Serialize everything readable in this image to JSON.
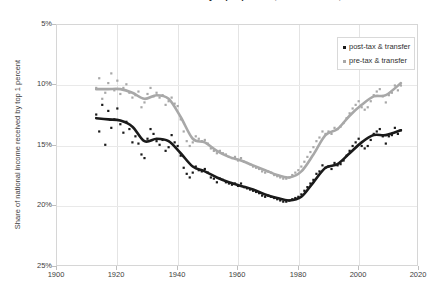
{
  "title": "Share of national income received by top 1 percent, United States, 1913-2014",
  "legend": {
    "position": "top-right",
    "items": [
      {
        "label": "post-tax & transfer",
        "color": "#1a1a1a"
      },
      {
        "label": "pre-tax & transfer",
        "color": "#a8a8a8"
      }
    ]
  },
  "axes": {
    "ylabel": "Share of national income received by top 1 percent",
    "xlabel": "",
    "yticks": [
      "5%",
      "10%",
      "15%",
      "20%",
      "25%"
    ],
    "xticks": [
      "1900",
      "1920",
      "1940",
      "1960",
      "1980",
      "2000",
      "2020"
    ]
  },
  "colors": {
    "post_tax": "#1a1a1a",
    "pre_tax": "#a8a8a8",
    "grid": "#e4e4e4",
    "frame": "#d6d6d6",
    "text": "#3d3d3d"
  },
  "chart_data": {
    "type": "scatter",
    "title": "Share of national income received by top 1 percent, United States, 1913-2014",
    "xlabel": "",
    "ylabel": "Share of national income received by top 1 percent",
    "xlim": [
      1900,
      2020
    ],
    "ylim": [
      25,
      5
    ],
    "y_axis_inverted": true,
    "yticks": [
      5,
      10,
      15,
      20,
      25
    ],
    "xticks": [
      1900,
      1920,
      1940,
      1960,
      1980,
      2000,
      2020
    ],
    "grid": true,
    "legend": [
      "post-tax & transfer",
      "pre-tax & transfer"
    ],
    "series": [
      {
        "name": "post-tax & transfer",
        "color": "#1a1a1a",
        "marker": "square",
        "points": [
          [
            1913,
            17.6
          ],
          [
            1914,
            16.2
          ],
          [
            1915,
            18.4
          ],
          [
            1916,
            15.1
          ],
          [
            1917,
            17.9
          ],
          [
            1918,
            16.5
          ],
          [
            1919,
            17.2
          ],
          [
            1920,
            18.1
          ],
          [
            1921,
            16.8
          ],
          [
            1922,
            16.1
          ],
          [
            1923,
            17.0
          ],
          [
            1924,
            16.4
          ],
          [
            1925,
            15.3
          ],
          [
            1926,
            15.8
          ],
          [
            1927,
            15.2
          ],
          [
            1928,
            14.3
          ],
          [
            1929,
            14.0
          ],
          [
            1930,
            15.6
          ],
          [
            1931,
            16.4
          ],
          [
            1932,
            16.0
          ],
          [
            1933,
            15.4
          ],
          [
            1934,
            15.1
          ],
          [
            1935,
            15.5
          ],
          [
            1936,
            14.6
          ],
          [
            1937,
            14.9
          ],
          [
            1938,
            15.9
          ],
          [
            1939,
            15.3
          ],
          [
            1940,
            15.0
          ],
          [
            1941,
            14.2
          ],
          [
            1942,
            13.2
          ],
          [
            1943,
            12.7
          ],
          [
            1944,
            12.4
          ],
          [
            1945,
            12.8
          ],
          [
            1946,
            13.3
          ],
          [
            1947,
            13.0
          ],
          [
            1948,
            12.9
          ],
          [
            1949,
            13.1
          ],
          [
            1950,
            12.8
          ],
          [
            1951,
            12.4
          ],
          [
            1952,
            12.3
          ],
          [
            1953,
            12.0
          ],
          [
            1954,
            12.3
          ],
          [
            1955,
            12.2
          ],
          [
            1956,
            12.0
          ],
          [
            1957,
            11.9
          ],
          [
            1958,
            11.8
          ],
          [
            1959,
            11.9
          ],
          [
            1960,
            11.7
          ],
          [
            1961,
            11.9
          ],
          [
            1962,
            11.6
          ],
          [
            1963,
            11.5
          ],
          [
            1964,
            11.4
          ],
          [
            1965,
            11.3
          ],
          [
            1966,
            11.2
          ],
          [
            1967,
            11.1
          ],
          [
            1968,
            10.9
          ],
          [
            1969,
            10.8
          ],
          [
            1970,
            10.9
          ],
          [
            1971,
            10.8
          ],
          [
            1972,
            10.7
          ],
          [
            1973,
            10.6
          ],
          [
            1974,
            10.5
          ],
          [
            1975,
            10.4
          ],
          [
            1976,
            10.4
          ],
          [
            1977,
            10.5
          ],
          [
            1978,
            10.6
          ],
          [
            1979,
            10.7
          ],
          [
            1980,
            10.8
          ],
          [
            1981,
            11.0
          ],
          [
            1982,
            11.3
          ],
          [
            1983,
            11.6
          ],
          [
            1984,
            11.9
          ],
          [
            1985,
            12.2
          ],
          [
            1986,
            12.7
          ],
          [
            1987,
            12.9
          ],
          [
            1988,
            13.4
          ],
          [
            1989,
            13.2
          ],
          [
            1990,
            13.3
          ],
          [
            1991,
            13.1
          ],
          [
            1992,
            13.6
          ],
          [
            1993,
            13.4
          ],
          [
            1994,
            13.5
          ],
          [
            1995,
            13.8
          ],
          [
            1996,
            14.2
          ],
          [
            1997,
            14.6
          ],
          [
            1998,
            15.0
          ],
          [
            1999,
            15.3
          ],
          [
            2000,
            15.6
          ],
          [
            2001,
            15.0
          ],
          [
            2002,
            14.8
          ],
          [
            2003,
            15.0
          ],
          [
            2004,
            15.5
          ],
          [
            2005,
            16.0
          ],
          [
            2006,
            16.2
          ],
          [
            2007,
            16.4
          ],
          [
            2008,
            15.8
          ],
          [
            2009,
            15.2
          ],
          [
            2010,
            15.8
          ],
          [
            2011,
            15.9
          ],
          [
            2012,
            16.5
          ],
          [
            2013,
            16.0
          ],
          [
            2014,
            16.3
          ]
        ],
        "trend": [
          [
            1913,
            17.3
          ],
          [
            1917,
            17.2
          ],
          [
            1921,
            17.1
          ],
          [
            1925,
            16.6
          ],
          [
            1929,
            15.4
          ],
          [
            1933,
            15.6
          ],
          [
            1937,
            15.4
          ],
          [
            1941,
            14.4
          ],
          [
            1945,
            13.3
          ],
          [
            1949,
            12.9
          ],
          [
            1953,
            12.4
          ],
          [
            1957,
            12.0
          ],
          [
            1961,
            11.7
          ],
          [
            1965,
            11.4
          ],
          [
            1969,
            11.0
          ],
          [
            1973,
            10.7
          ],
          [
            1977,
            10.5
          ],
          [
            1981,
            10.8
          ],
          [
            1985,
            12.0
          ],
          [
            1989,
            13.2
          ],
          [
            1993,
            13.5
          ],
          [
            1997,
            14.4
          ],
          [
            2001,
            15.3
          ],
          [
            2005,
            15.9
          ],
          [
            2009,
            15.9
          ],
          [
            2014,
            16.3
          ]
        ]
      },
      {
        "name": "pre-tax & transfer",
        "color": "#a8a8a8",
        "marker": "square",
        "points": [
          [
            1913,
            19.8
          ],
          [
            1914,
            20.6
          ],
          [
            1915,
            18.9
          ],
          [
            1916,
            19.4
          ],
          [
            1917,
            20.2
          ],
          [
            1918,
            21.0
          ],
          [
            1919,
            19.6
          ],
          [
            1920,
            20.4
          ],
          [
            1921,
            19.3
          ],
          [
            1922,
            19.8
          ],
          [
            1923,
            20.1
          ],
          [
            1924,
            19.4
          ],
          [
            1925,
            19.0
          ],
          [
            1926,
            19.2
          ],
          [
            1927,
            19.5
          ],
          [
            1928,
            18.2
          ],
          [
            1929,
            18.6
          ],
          [
            1930,
            19.3
          ],
          [
            1931,
            19.8
          ],
          [
            1932,
            19.1
          ],
          [
            1933,
            19.4
          ],
          [
            1934,
            19.0
          ],
          [
            1935,
            19.2
          ],
          [
            1936,
            18.4
          ],
          [
            1937,
            18.7
          ],
          [
            1938,
            19.0
          ],
          [
            1939,
            18.5
          ],
          [
            1940,
            18.3
          ],
          [
            1941,
            17.2
          ],
          [
            1942,
            16.2
          ],
          [
            1943,
            15.4
          ],
          [
            1944,
            15.0
          ],
          [
            1945,
            15.3
          ],
          [
            1946,
            15.8
          ],
          [
            1947,
            15.6
          ],
          [
            1948,
            15.4
          ],
          [
            1949,
            15.5
          ],
          [
            1950,
            15.2
          ],
          [
            1951,
            14.8
          ],
          [
            1952,
            14.6
          ],
          [
            1953,
            14.4
          ],
          [
            1954,
            14.6
          ],
          [
            1955,
            14.4
          ],
          [
            1956,
            14.3
          ],
          [
            1957,
            14.1
          ],
          [
            1958,
            14.0
          ],
          [
            1959,
            14.1
          ],
          [
            1960,
            13.8
          ],
          [
            1961,
            14.0
          ],
          [
            1962,
            13.7
          ],
          [
            1963,
            13.6
          ],
          [
            1964,
            13.5
          ],
          [
            1965,
            13.3
          ],
          [
            1966,
            13.2
          ],
          [
            1967,
            13.1
          ],
          [
            1968,
            12.9
          ],
          [
            1969,
            12.8
          ],
          [
            1970,
            12.9
          ],
          [
            1971,
            12.8
          ],
          [
            1972,
            12.6
          ],
          [
            1973,
            12.5
          ],
          [
            1974,
            12.4
          ],
          [
            1975,
            12.3
          ],
          [
            1976,
            12.3
          ],
          [
            1977,
            12.4
          ],
          [
            1978,
            12.6
          ],
          [
            1979,
            12.8
          ],
          [
            1980,
            13.0
          ],
          [
            1981,
            13.3
          ],
          [
            1982,
            13.7
          ],
          [
            1983,
            14.1
          ],
          [
            1984,
            14.5
          ],
          [
            1985,
            14.9
          ],
          [
            1986,
            15.4
          ],
          [
            1987,
            15.7
          ],
          [
            1988,
            16.2
          ],
          [
            1989,
            16.0
          ],
          [
            1990,
            16.2
          ],
          [
            1991,
            16.0
          ],
          [
            1992,
            16.5
          ],
          [
            1993,
            16.4
          ],
          [
            1994,
            16.6
          ],
          [
            1995,
            16.9
          ],
          [
            1996,
            17.3
          ],
          [
            1997,
            17.7
          ],
          [
            1998,
            18.1
          ],
          [
            1999,
            18.4
          ],
          [
            2000,
            18.7
          ],
          [
            2001,
            18.2
          ],
          [
            2002,
            18.0
          ],
          [
            2003,
            18.2
          ],
          [
            2004,
            18.7
          ],
          [
            2005,
            19.2
          ],
          [
            2006,
            19.5
          ],
          [
            2007,
            19.7
          ],
          [
            2008,
            19.1
          ],
          [
            2009,
            18.6
          ],
          [
            2010,
            19.2
          ],
          [
            2011,
            19.4
          ],
          [
            2012,
            20.0
          ],
          [
            2013,
            19.6
          ],
          [
            2014,
            20.0
          ]
        ],
        "trend": [
          [
            1913,
            19.7
          ],
          [
            1917,
            19.7
          ],
          [
            1921,
            19.7
          ],
          [
            1925,
            19.4
          ],
          [
            1929,
            18.9
          ],
          [
            1933,
            19.2
          ],
          [
            1937,
            18.9
          ],
          [
            1941,
            17.4
          ],
          [
            1945,
            15.6
          ],
          [
            1949,
            15.3
          ],
          [
            1953,
            14.6
          ],
          [
            1957,
            14.1
          ],
          [
            1961,
            13.8
          ],
          [
            1965,
            13.4
          ],
          [
            1969,
            13.0
          ],
          [
            1973,
            12.6
          ],
          [
            1977,
            12.4
          ],
          [
            1981,
            12.9
          ],
          [
            1985,
            14.3
          ],
          [
            1989,
            15.9
          ],
          [
            1993,
            16.4
          ],
          [
            1997,
            17.5
          ],
          [
            2001,
            18.4
          ],
          [
            2005,
            19.1
          ],
          [
            2009,
            19.2
          ],
          [
            2014,
            20.2
          ]
        ]
      }
    ]
  }
}
